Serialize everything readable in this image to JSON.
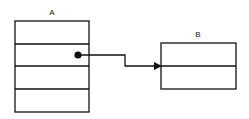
{
  "diagram": {
    "nodes": [
      {
        "id": "A",
        "label": "A",
        "rows": 4
      },
      {
        "id": "B",
        "label": "B",
        "rows": 2
      }
    ],
    "edges": [
      {
        "from": "A.row2",
        "to": "B.row2",
        "style": "pointer-arrow",
        "source_marker": "filled-dot",
        "target_marker": "arrowhead"
      }
    ]
  },
  "colors": {
    "stroke": "#111111",
    "background": "#ffffff"
  }
}
